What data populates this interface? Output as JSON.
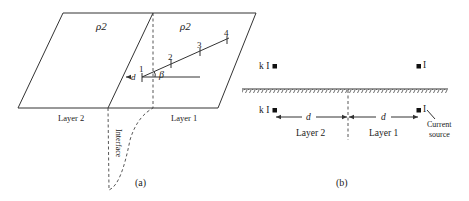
{
  "panel_a": {
    "caption": "(a)",
    "resistivity_left": "ρ2",
    "resistivity_right": "ρ2",
    "layer_left": "Layer 2",
    "layer_right": "Layer 1",
    "interface_label": "Interface",
    "distance_label": "d",
    "angle_label": "β",
    "electrodes": [
      "1",
      "2",
      "3",
      "4"
    ]
  },
  "panel_b": {
    "caption": "(b)",
    "image_source_top": "k I",
    "source_top": "I",
    "image_source_bottom": "k I",
    "source_bottom": "I",
    "distance_left": "d",
    "distance_right": "d",
    "layer_left": "Layer 2",
    "layer_right": "Layer 1",
    "source_note_line1": "Current",
    "source_note_line2": "source"
  }
}
